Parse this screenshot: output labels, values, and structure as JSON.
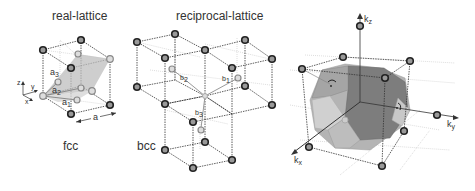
{
  "panels": {
    "real": {
      "title": "real-lattice",
      "lattice_label": "fcc",
      "vectors": [
        "a1",
        "a2",
        "a3"
      ],
      "vector_labels": {
        "a1": "a",
        "a1_sub": "1",
        "a2": "a",
        "a2_sub": "2",
        "a3": "a",
        "a3_sub": "3"
      },
      "lattice_constant": "a",
      "axes": {
        "x": "x",
        "y": "y",
        "z": "z"
      }
    },
    "reciprocal": {
      "title": "reciprocal-lattice",
      "lattice_label": "bcc",
      "vectors": {
        "b1": "b",
        "b1_sub": "1",
        "b2": "b",
        "b2_sub": "2",
        "b3": "b",
        "b3_sub": "3"
      }
    },
    "brillouin": {
      "axes": {
        "kx": "k",
        "kx_sub": "x",
        "ky": "k",
        "ky_sub": "y",
        "kz": "k",
        "kz_sub": "z"
      }
    }
  },
  "colors": {
    "background": "#ffffff",
    "edges": "#333333",
    "atom_fill": "#999999",
    "atom_stroke": "#222222",
    "zone_dark": "#7a7a7a",
    "zone_mid": "#a5a5a5",
    "zone_light": "#d2d2d2"
  }
}
